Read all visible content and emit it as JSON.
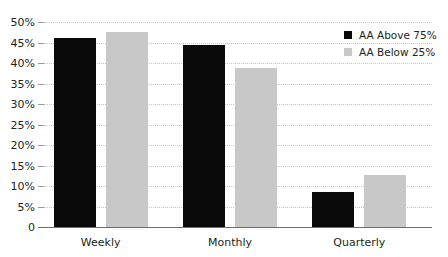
{
  "chart_data": {
    "type": "bar",
    "title": "",
    "subtitle": "",
    "xlabel": "",
    "ylabel": "",
    "categories": [
      "Weekly",
      "Monthly",
      "Quarterly"
    ],
    "series": [
      {
        "name": "AA Above 75%",
        "color": "#0a0a0a",
        "values": [
          46,
          44.5,
          8.5
        ]
      },
      {
        "name": "AA Below 25%",
        "color": "#c8c8c8",
        "values": [
          47.5,
          38.8,
          12.7
        ]
      }
    ],
    "ylim": [
      0,
      50
    ],
    "ytick_values": [
      0,
      5,
      10,
      15,
      20,
      25,
      30,
      35,
      40,
      45,
      50
    ],
    "ytick_labels": [
      "0",
      "5%",
      "10%",
      "15%",
      "20%",
      "25%",
      "30%",
      "35%",
      "40%",
      "45%",
      "50%"
    ],
    "grid": true,
    "grid_axis": "y",
    "grid_style": "dotted",
    "legend_position": "top-right",
    "background_color": "#ffffff",
    "axis_color": "#6d6e70"
  }
}
